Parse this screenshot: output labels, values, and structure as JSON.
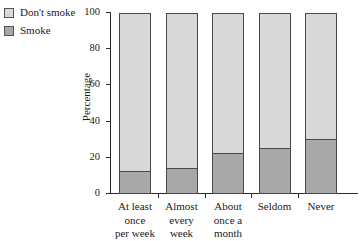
{
  "legend": {
    "items": [
      {
        "label": "Don't smoke",
        "color": "#d8d8d8",
        "key": "dont-smoke"
      },
      {
        "label": "Smoke",
        "color": "#a8a8a8",
        "key": "smoke"
      }
    ]
  },
  "axes": {
    "y_title": "Percentage",
    "y_ticks": [
      "0",
      "20",
      "40",
      "60",
      "80",
      "100"
    ],
    "x_title": ""
  },
  "chart_data": {
    "type": "bar",
    "stacked": true,
    "percent": true,
    "title": "",
    "xlabel": "",
    "ylabel": "Percentage",
    "ylim": [
      0,
      100
    ],
    "yticks": [
      0,
      20,
      40,
      60,
      80,
      100
    ],
    "grid": false,
    "legend_position": "top-left",
    "categories": [
      "At least once per week",
      "Almost every week",
      "About once a month",
      "Seldom",
      "Never"
    ],
    "category_lines": [
      [
        "At least",
        "once",
        "per week"
      ],
      [
        "Almost",
        "every week"
      ],
      [
        "About",
        "once a",
        "month"
      ],
      [
        "Seldom"
      ],
      [
        "Never"
      ]
    ],
    "series": [
      {
        "name": "Smoke",
        "color": "#a8a8a8",
        "values": [
          12,
          14,
          22,
          25,
          30
        ]
      },
      {
        "name": "Don't smoke",
        "color": "#d8d8d8",
        "values": [
          88,
          86,
          78,
          75,
          70
        ]
      }
    ]
  }
}
